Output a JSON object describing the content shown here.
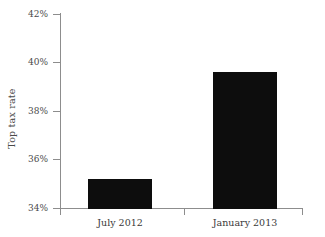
{
  "chart_data": {
    "type": "bar",
    "title": "",
    "xlabel": "",
    "ylabel": "Top tax rate",
    "categories": [
      "July 2012",
      "January 2013"
    ],
    "values": [
      35.2,
      39.6
    ],
    "value_labels": [
      "35.2%",
      "39.6%"
    ],
    "ylim": [
      34,
      42
    ],
    "yticks": [
      34,
      36,
      38,
      40,
      42
    ],
    "ytick_labels": [
      "34%",
      "36%",
      "38%",
      "40%",
      "42%"
    ],
    "grid": false,
    "legend": false,
    "bar_color": "#0d0d0d",
    "axis_color": "#8d8d8d",
    "background_color": "#ffffff"
  },
  "axis": {
    "y_label": "Top tax rate",
    "y_ticks": [
      {
        "label": "42%",
        "value": 42
      },
      {
        "label": "40%",
        "value": 40
      },
      {
        "label": "38%",
        "value": 38
      },
      {
        "label": "36%",
        "value": 36
      },
      {
        "label": "34%",
        "value": 34
      }
    ],
    "x_ticks": [
      {
        "label": "July 2012"
      },
      {
        "label": "January 2013"
      }
    ]
  }
}
